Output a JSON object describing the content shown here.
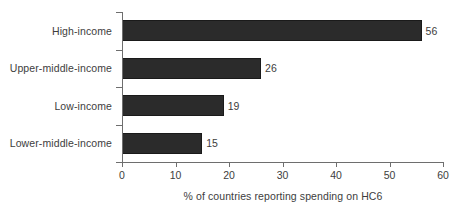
{
  "chart_data": {
    "type": "bar",
    "orientation": "horizontal",
    "title": "",
    "xlabel": "% of countries reporting spending on HC6",
    "ylabel": "",
    "categories": [
      "High-income",
      "Upper-middle-income",
      "Low-income",
      "Lower-middle-income"
    ],
    "values": [
      56,
      26,
      19,
      15
    ],
    "value_labels": [
      "56",
      "26",
      "19",
      "15"
    ],
    "xlim": [
      0,
      60
    ],
    "xticks": [
      0,
      10,
      20,
      30,
      40,
      50,
      60
    ],
    "xtick_labels": [
      "0",
      "10",
      "20",
      "30",
      "40",
      "50",
      "60"
    ],
    "grid": false,
    "legend": false,
    "bar_color": "#2b2b2b",
    "axis_color": "#6e6e6e",
    "text_color": "#3d3d3d",
    "background_color": "#ffffff"
  }
}
